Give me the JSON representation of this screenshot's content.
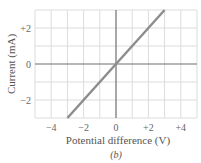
{
  "chart_data": {
    "type": "line",
    "title": "",
    "caption": "(b)",
    "xlabel": "Potential difference (V)",
    "ylabel": "Current (mA)",
    "xlim": [
      -5,
      5
    ],
    "ylim": [
      -3,
      3
    ],
    "xticks": [
      -4,
      -2,
      0,
      2,
      4
    ],
    "xtick_labels": [
      "−4",
      "−2",
      "0",
      "+2",
      "+4"
    ],
    "yticks": [
      -2,
      0,
      2
    ],
    "ytick_labels": [
      "−2",
      "0",
      "+2"
    ],
    "grid": true,
    "grid_step_x": 1,
    "grid_step_y": 1,
    "series": [
      {
        "name": "I-V characteristic",
        "x": [
          -3,
          3
        ],
        "y": [
          -3,
          3
        ]
      }
    ],
    "colors": {
      "line": "#8c8c8c",
      "axes": "#6e6e6e",
      "grid": "#dcdcdc",
      "text": "#555555"
    }
  }
}
